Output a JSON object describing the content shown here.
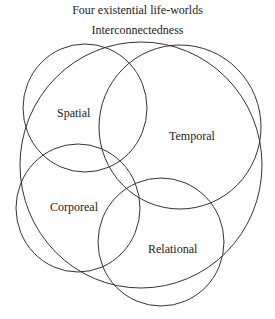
{
  "title": "Four existential life-worlds",
  "subtitle": "Interconnectedness",
  "stroke_color": "#333333",
  "circles": [
    {
      "label": "Spatial",
      "label_x": 66,
      "label_y": 113
    },
    {
      "label": "Temporal",
      "label_x": 189,
      "label_y": 139
    },
    {
      "label": "Corporeal",
      "label_x": 50,
      "label_y": 211
    },
    {
      "label": "Relational",
      "label_x": 148,
      "label_y": 253
    }
  ],
  "outer": {
    "label": "Interconnectedness"
  }
}
